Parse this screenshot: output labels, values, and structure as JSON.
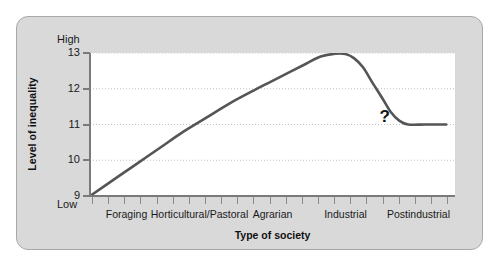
{
  "chart_data": {
    "type": "line",
    "title": "",
    "xlabel": "Type of society",
    "ylabel": "Level of inequality",
    "y_high_label": "High",
    "y_low_label": "Low",
    "yticks": [
      13,
      12,
      11,
      10,
      9
    ],
    "ylim": [
      9,
      13
    ],
    "grid": "horizontal-dotted",
    "legend": "none",
    "categories": [
      "Foraging",
      "Horticultural/Pastoral",
      "Agrarian",
      "Industrial",
      "Postindustrial"
    ],
    "annotations": [
      {
        "text": "?",
        "x": 0.925,
        "y": 11.0
      }
    ],
    "series": [
      {
        "name": "Level of inequality by type of society",
        "points": [
          {
            "x": 0.0,
            "y": 9.0
          },
          {
            "x": 0.08,
            "y": 9.45
          },
          {
            "x": 0.16,
            "y": 9.9
          },
          {
            "x": 0.24,
            "y": 10.35
          },
          {
            "x": 0.32,
            "y": 10.8
          },
          {
            "x": 0.4,
            "y": 11.2
          },
          {
            "x": 0.48,
            "y": 11.6
          },
          {
            "x": 0.56,
            "y": 11.95
          },
          {
            "x": 0.62,
            "y": 12.2
          },
          {
            "x": 0.68,
            "y": 12.45
          },
          {
            "x": 0.74,
            "y": 12.7
          },
          {
            "x": 0.79,
            "y": 12.9
          },
          {
            "x": 0.84,
            "y": 12.98
          },
          {
            "x": 0.875,
            "y": 12.97
          },
          {
            "x": 0.905,
            "y": 12.85
          },
          {
            "x": 0.935,
            "y": 12.6
          },
          {
            "x": 0.965,
            "y": 12.2
          },
          {
            "x": 1.0,
            "y": 11.75
          },
          {
            "x": 1.03,
            "y": 11.35
          },
          {
            "x": 1.06,
            "y": 11.1
          },
          {
            "x": 1.09,
            "y": 11.0
          },
          {
            "x": 1.15,
            "y": 11.0
          },
          {
            "x": 1.22,
            "y": 11.0
          }
        ]
      }
    ],
    "colors": {
      "line": "#555555",
      "grid": "#c0c0c0",
      "axis": "#7a7a7a",
      "plot_background": "#ffffff",
      "panel_background": "#d9d9d9",
      "panel_border": "#a8a8a8",
      "text": "#1a1a1a"
    }
  }
}
